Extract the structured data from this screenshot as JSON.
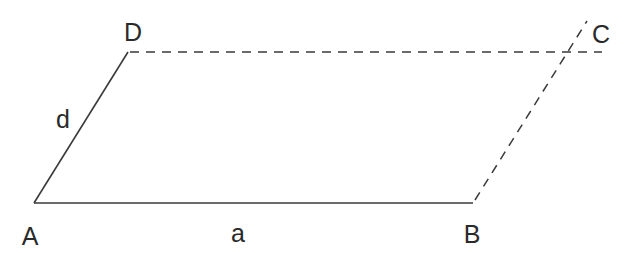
{
  "diagram": {
    "type": "parallelogram-construction",
    "stroke_color": "#3a3a3a",
    "vertices": {
      "A": {
        "label": "A",
        "x": 34,
        "y": 203
      },
      "B": {
        "label": "B",
        "x": 473,
        "y": 203
      },
      "D": {
        "label": "D",
        "x": 128,
        "y": 52
      },
      "C": {
        "label": "C",
        "x": 567,
        "y": 52
      }
    },
    "edges": [
      {
        "from": "A",
        "to": "B",
        "style": "solid",
        "label": "a"
      },
      {
        "from": "A",
        "to": "D",
        "style": "solid",
        "label": "d"
      },
      {
        "from": "D",
        "to": "C",
        "style": "dashed",
        "label": ""
      },
      {
        "from": "B",
        "to": "C",
        "style": "dashed",
        "label": ""
      }
    ],
    "labels": {
      "A": "A",
      "B": "B",
      "C": "C",
      "D": "D",
      "a": "a",
      "d": "d"
    }
  }
}
